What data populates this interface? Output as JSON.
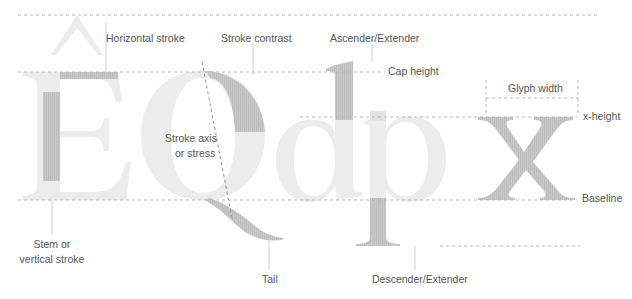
{
  "diagram": {
    "specimen_glyphs": [
      "Ê",
      "Q",
      "d",
      "p",
      "x"
    ],
    "colors": {
      "glyph_light": "#ececec",
      "glyph_highlight": "#c6c6c6",
      "guide_line": "#b5b5b5",
      "leader_line": "#cfcfcf",
      "label_text": "#555555"
    },
    "guides": {
      "ascender_top": {
        "label": ""
      },
      "cap_height": {
        "label": "Cap height"
      },
      "x_height": {
        "label": "x-height"
      },
      "baseline": {
        "label": "Baseline"
      },
      "descender": {
        "label": ""
      }
    },
    "labels": {
      "horizontal_stroke": "Horizontal stroke",
      "stroke_contrast": "Stroke contrast",
      "ascender": "Ascender/Extender",
      "cap_height": "Cap height",
      "glyph_width": "Glyph width",
      "x_height": "x-height",
      "stroke_axis_line1": "Stroke axis",
      "stroke_axis_line2": "or stress",
      "baseline": "Baseline",
      "stem_line1": "Stem or",
      "stem_line2": "vertical stroke",
      "tail": "Tail",
      "descender": "Descender/Extender"
    }
  }
}
